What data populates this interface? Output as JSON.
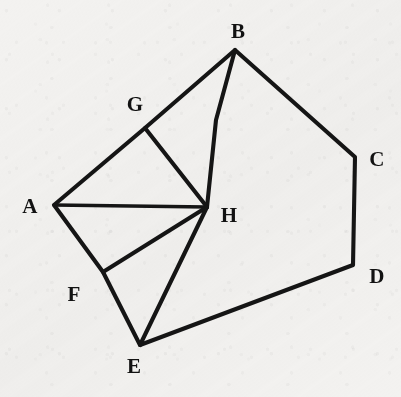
{
  "figure": {
    "background_color": "#f3f2f0",
    "stroke_color": "#151515",
    "label_color": "#121212",
    "canvas": {
      "width": 401,
      "height": 397
    }
  },
  "chart_data": {
    "type": "diagram",
    "points": [
      {
        "label": "A",
        "x": 54,
        "y": 205,
        "label_x": 30,
        "label_y": 206
      },
      {
        "label": "B",
        "x": 235,
        "y": 50,
        "label_x": 238,
        "label_y": 31
      },
      {
        "label": "C",
        "x": 355,
        "y": 157,
        "label_x": 377,
        "label_y": 159
      },
      {
        "label": "D",
        "x": 353,
        "y": 265,
        "label_x": 377,
        "label_y": 276
      },
      {
        "label": "E",
        "x": 140,
        "y": 345,
        "label_x": 134,
        "label_y": 366
      },
      {
        "label": "F",
        "x": 103,
        "y": 272,
        "label_x": 74,
        "label_y": 294
      },
      {
        "label": "G",
        "x": 145,
        "y": 128,
        "label_x": 135,
        "label_y": 104
      },
      {
        "label": "H",
        "x": 207,
        "y": 207,
        "label_x": 229,
        "label_y": 215
      }
    ],
    "edges": [
      {
        "from": "A",
        "to": "B",
        "via": "G"
      },
      {
        "from": "B",
        "to": "C"
      },
      {
        "from": "C",
        "to": "D"
      },
      {
        "from": "D",
        "to": "E"
      },
      {
        "from": "E",
        "to": "A",
        "via": "F"
      },
      {
        "from": "A",
        "to": "H"
      },
      {
        "from": "B",
        "to": "H"
      },
      {
        "from": "G",
        "to": "H"
      },
      {
        "from": "F",
        "to": "H"
      },
      {
        "from": "E",
        "to": "H"
      }
    ]
  },
  "paths": {
    "outline": "M 54 205 L 145 128 L 235 50 L 355 157 L 353 265 L 140 345 L 103 272 Z",
    "a_h": "M 54 205 L 207 207",
    "b_h": "M 235 50 L 216 120 L 207 207",
    "g_h": "M 145 128 L 207 207",
    "f_h": "M 103 272 L 207 207",
    "e_h": "M 140 345 L 207 207"
  },
  "labels": {
    "a": "A",
    "b": "B",
    "c": "C",
    "d": "D",
    "e": "E",
    "f": "F",
    "g": "G",
    "h": "H"
  }
}
